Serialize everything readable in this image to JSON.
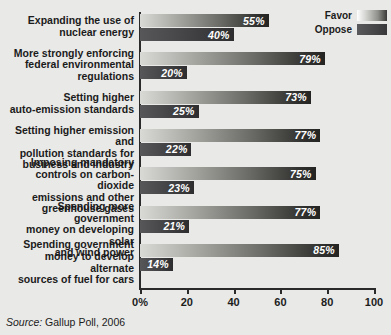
{
  "chart_data": {
    "type": "bar",
    "orientation": "horizontal",
    "title": "",
    "xlabel": "",
    "ylabel": "",
    "xlim": [
      0,
      100
    ],
    "grid": false,
    "legend_position": "top-right",
    "categories": [
      "Expanding the use of\nnuclear energy",
      "More strongly enforcing\nfederal environmental\nregulations",
      "Setting higher\nauto-emission standards",
      "Setting higher emission and\npollution standards for\nbusiness and industry",
      "Imposing mandatory\ncontrols on carbon-dioxide\nemissions and other\ngreenhouse gases",
      "Spending more government\nmoney on developing solar\nand wind power",
      "Spending government\nmoney to develop alternate\nsources of fuel for cars"
    ],
    "series": [
      {
        "name": "Favor",
        "values": [
          55,
          79,
          73,
          77,
          75,
          77,
          85
        ],
        "labels": [
          "55%",
          "79%",
          "73%",
          "77%",
          "75%",
          "77%",
          "85%"
        ]
      },
      {
        "name": "Oppose",
        "values": [
          40,
          20,
          25,
          22,
          23,
          21,
          14
        ],
        "labels": [
          "40%",
          "20%",
          "25%",
          "22%",
          "23%",
          "21%",
          "14%"
        ]
      }
    ],
    "xticks": [
      0,
      20,
      40,
      60,
      80,
      100
    ],
    "xtick_labels": [
      "0%",
      "20",
      "40",
      "60",
      "80",
      "100"
    ]
  },
  "legend": {
    "items": [
      {
        "label": "Favor",
        "swatch": "favor"
      },
      {
        "label": "Oppose",
        "swatch": "oppose"
      }
    ]
  },
  "source": {
    "prefix": "Source:",
    "text": "Gallup Poll, 2006"
  }
}
